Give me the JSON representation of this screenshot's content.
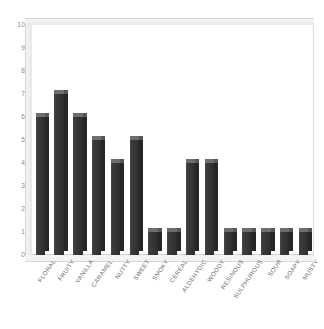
{
  "chart_data": {
    "type": "bar",
    "title": "",
    "subtitle": "",
    "xlabel": "",
    "ylabel": "",
    "ylim": [
      0,
      10
    ],
    "ytick_step": 1,
    "grid": false,
    "legend": "none",
    "style": "3d-column",
    "categories": [
      "FLORAL",
      "FRUITY",
      "VANILLA",
      "CARAMEL",
      "NUTTY",
      "SWEET",
      "SMOKY",
      "CEREAL",
      "ALDEHYDIC",
      "WOODY",
      "RESINOUS",
      "SULPHUROUS",
      "SOUR",
      "SOAPY",
      "MUSTY"
    ],
    "values": [
      6,
      7,
      6,
      5,
      4,
      5,
      1,
      1,
      4,
      4,
      1,
      1,
      1,
      1,
      1
    ],
    "ytick_labels": [
      "0",
      "1",
      "2",
      "3",
      "4",
      "5",
      "6",
      "7",
      "8",
      "9",
      "10"
    ],
    "colors": {
      "bar_face": "#343434",
      "bar_side": "#262626",
      "bar_top": "#6e6e6e",
      "plot_background": "#ffffff",
      "wall": "#ebebeb",
      "axis_text": "#8a8a8a",
      "label_text": "#6f6f6f"
    }
  }
}
